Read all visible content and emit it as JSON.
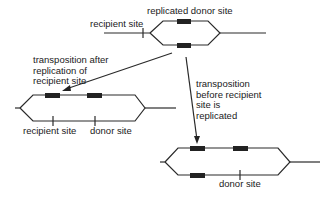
{
  "diagram": {
    "top": {
      "label_donor": "replicated donor site",
      "label_recipient": "recipient site"
    },
    "left_pathway": {
      "caption": "transposition after\nreplication of\nrecipient site",
      "label_recipient": "recipient site",
      "label_donor": "donor site"
    },
    "right_pathway": {
      "caption": "transposition\nbefore recipient\nsite is\nreplicated",
      "label_donor": "donor site"
    },
    "colors": {
      "line": "#2a2a2a",
      "element": "#222222",
      "background": "#ffffff"
    }
  }
}
